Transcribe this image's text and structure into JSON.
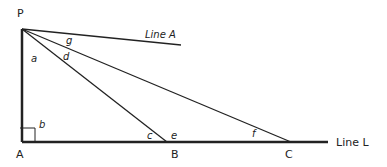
{
  "diagram": {
    "points": {
      "P": "P",
      "A": "A",
      "B": "B",
      "C": "C"
    },
    "lines": {
      "line_a": "Line A",
      "line_l": "Line L"
    },
    "angles": {
      "a": "a",
      "b": "b",
      "c": "c",
      "d": "d",
      "e": "e",
      "f": "f",
      "g": "g"
    },
    "colors": {
      "stroke": "#222222",
      "background": "#ffffff"
    }
  }
}
